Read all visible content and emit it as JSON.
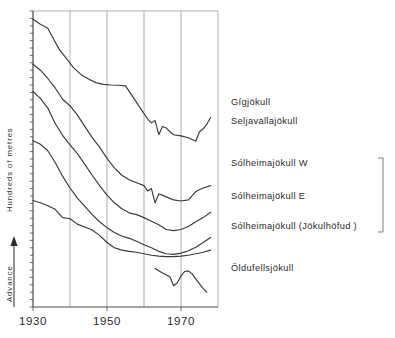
{
  "chart_data": {
    "type": "line",
    "title": "",
    "subtitle": "",
    "xlabel": "",
    "ylabel": "Hundreds of metres",
    "y_direction_label": "Advance",
    "xlim": [
      1930,
      1980
    ],
    "ylim": [
      0,
      10
    ],
    "x_ticks": [
      1930,
      1950,
      1970
    ],
    "x_tick_labels": [
      "1930",
      "1950",
      "1970"
    ],
    "gridlines_x": [
      1930,
      1940,
      1950,
      1960,
      1970,
      1980
    ],
    "grid": true,
    "legend": "inline-right-labels",
    "y_minor_tick_count": 40,
    "annotations": [
      {
        "text": "bracket grouping the three Solheimajokull series",
        "type": "bracket",
        "covers": [
          "Sólheimajökull  W",
          "Sólheimajökull  E",
          "Sólheimajökull  (Jökulhöfud)"
        ]
      }
    ],
    "series": [
      {
        "name": "Gígjökull",
        "label": "Gígjökull",
        "x": [
          1930,
          1932,
          1934,
          1935,
          1937,
          1939,
          1941,
          1943,
          1945,
          1947,
          1949,
          1951,
          1953,
          1955,
          1957,
          1959,
          1961,
          1962,
          1963,
          1964,
          1965,
          1966,
          1967,
          1968,
          1970,
          1972,
          1974,
          1975,
          1976,
          1977,
          1978
        ],
        "y": [
          9.72,
          9.55,
          9.42,
          9.18,
          8.72,
          8.4,
          8.08,
          7.85,
          7.7,
          7.58,
          7.52,
          7.5,
          7.49,
          7.47,
          7.1,
          6.72,
          6.35,
          6.22,
          6.3,
          5.82,
          6.1,
          6.05,
          5.92,
          5.82,
          5.78,
          5.72,
          5.6,
          5.92,
          6.02,
          6.18,
          6.4
        ]
      },
      {
        "name": "Seljavallajökull",
        "label": "Seljavallajökull",
        "x": [
          1930,
          1932,
          1934,
          1936,
          1938,
          1940,
          1942,
          1944,
          1946,
          1948,
          1950,
          1952,
          1954,
          1956,
          1958,
          1960,
          1961,
          1962,
          1963,
          1964,
          1965,
          1966,
          1968,
          1970,
          1972,
          1974,
          1976,
          1978
        ],
        "y": [
          8.2,
          8.0,
          7.72,
          7.4,
          7.02,
          6.8,
          6.48,
          6.1,
          5.72,
          5.4,
          5.02,
          4.7,
          4.45,
          4.3,
          4.2,
          4.1,
          3.92,
          4.0,
          3.52,
          3.82,
          3.78,
          3.72,
          3.62,
          3.58,
          3.62,
          3.9,
          4.02,
          4.1
        ]
      },
      {
        "name": "Sólheimajökull W",
        "label": "Sólheimajökull   W",
        "x": [
          1930,
          1932,
          1934,
          1936,
          1938,
          1940,
          1942,
          1944,
          1946,
          1948,
          1950,
          1952,
          1954,
          1956,
          1958,
          1960,
          1962,
          1964,
          1966,
          1968,
          1970,
          1972,
          1974,
          1976,
          1978
        ],
        "y": [
          7.28,
          7.05,
          6.72,
          6.2,
          5.8,
          5.48,
          5.18,
          4.82,
          4.45,
          4.1,
          3.78,
          3.52,
          3.32,
          3.18,
          3.12,
          3.02,
          2.9,
          2.78,
          2.62,
          2.58,
          2.62,
          2.72,
          2.88,
          3.02,
          3.2
        ]
      },
      {
        "name": "Sólheimajökull E",
        "label": "Sólheimajökull   E",
        "x": [
          1930,
          1932,
          1934,
          1936,
          1938,
          1940,
          1942,
          1944,
          1946,
          1948,
          1950,
          1952,
          1954,
          1956,
          1958,
          1960,
          1962,
          1964,
          1966,
          1968,
          1970,
          1972,
          1974,
          1976,
          1978
        ],
        "y": [
          5.62,
          5.5,
          5.28,
          4.88,
          4.42,
          4.02,
          3.68,
          3.4,
          3.12,
          2.88,
          2.68,
          2.52,
          2.4,
          2.32,
          2.22,
          2.1,
          2.0,
          1.88,
          1.8,
          1.78,
          1.82,
          1.9,
          2.02,
          2.18,
          2.35
        ]
      },
      {
        "name": "Sólheimajökull (Jökulhöfud)",
        "label": "Sólheimajökull   (Jökulhöfud )",
        "x": [
          1930,
          1932,
          1934,
          1936,
          1938,
          1940,
          1942,
          1944,
          1946,
          1948,
          1950,
          1952,
          1954,
          1956,
          1958,
          1960,
          1962,
          1964,
          1966,
          1968,
          1970,
          1972,
          1974,
          1976,
          1978
        ],
        "y": [
          3.6,
          3.52,
          3.42,
          3.3,
          3.02,
          2.98,
          2.8,
          2.7,
          2.6,
          2.42,
          2.18,
          2.0,
          1.92,
          1.88,
          1.85,
          1.8,
          1.75,
          1.72,
          1.7,
          1.7,
          1.72,
          1.75,
          1.8,
          1.85,
          1.92
        ]
      },
      {
        "name": "Öldufellsjökull",
        "label": "Öldufellsjökull",
        "x": [
          1963,
          1965,
          1967,
          1968,
          1969,
          1970,
          1971,
          1972,
          1973,
          1974,
          1975,
          1976,
          1977
        ],
        "y": [
          1.3,
          1.15,
          1.02,
          0.72,
          0.82,
          1.05,
          1.2,
          1.22,
          1.12,
          0.95,
          0.78,
          0.62,
          0.5
        ]
      }
    ]
  },
  "axis": {
    "y_label": "Hundreds of metres",
    "advance_label": "Advance",
    "x_tick_labels": [
      "1930",
      "1950",
      "1970"
    ]
  },
  "labels": {
    "gigjokull": "Gígjökull",
    "seljavallajokull": "Seljavallajökull",
    "solheimajokull_w": "Sólheimajökull   W",
    "solheimajokull_e": "Sólheimajökull   E",
    "solheimajokull_jokulhofud": "Sólheimajökull   (Jökulhöfud )",
    "oldufellsjokull": "Öldufellsjökull"
  },
  "colors": {
    "background": "#ffffff",
    "axis": "#4a4a4a",
    "grid": "#8d8d8d",
    "series": "#3a3a3a",
    "text": "#2b2b2b"
  }
}
